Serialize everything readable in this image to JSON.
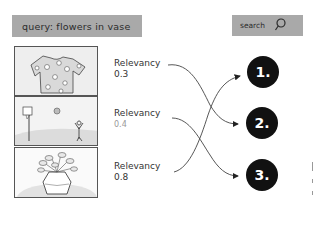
{
  "query": {
    "label": "query: flowers in vase"
  },
  "search": {
    "label": "search",
    "icon": "search-icon"
  },
  "results": [
    {
      "image": "t-shirt with flower print",
      "relevancy_label": "Relevancy",
      "relevancy_value": "0.3",
      "target_rank": 2
    },
    {
      "image": "person playing basketball",
      "relevancy_label": "Relevancy",
      "relevancy_value": "0.4",
      "target_rank": 3
    },
    {
      "image": "flowers in a vase",
      "relevancy_label": "Relevancy",
      "relevancy_value": "0.8",
      "target_rank": 1
    }
  ],
  "ranks": [
    {
      "label": "1."
    },
    {
      "label": "2."
    },
    {
      "label": "3."
    }
  ],
  "colors": {
    "box_fill": "#a9a9a9",
    "rank_circle": "#111111",
    "stroke": "#333333"
  }
}
